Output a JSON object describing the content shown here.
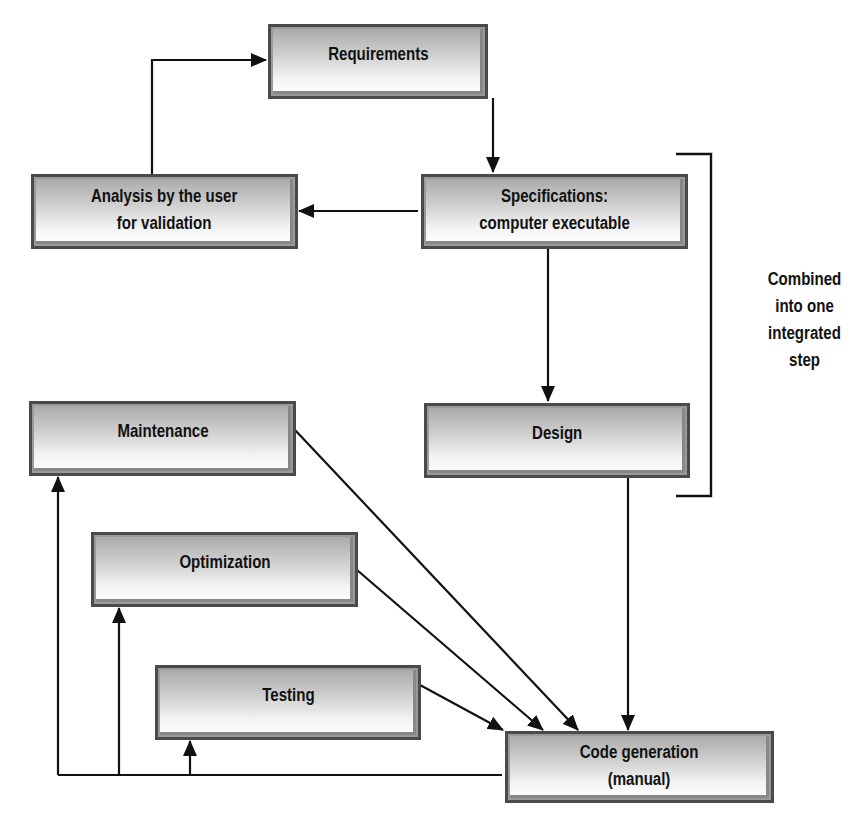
{
  "diagram": {
    "type": "flowchart",
    "nodes": {
      "requirements": {
        "label": "Requirements"
      },
      "analysis": {
        "label": "Analysis by the user\nfor validation"
      },
      "specifications": {
        "label": "Specifications:\ncomputer executable"
      },
      "maintenance": {
        "label": "Maintenance"
      },
      "design": {
        "label": "Design"
      },
      "optimization": {
        "label": "Optimization"
      },
      "testing": {
        "label": "Testing"
      },
      "code_generation": {
        "label": "Code generation\n(manual)"
      }
    },
    "bracket_note": {
      "label": "Combined\ninto one\nintegrated\nstep",
      "spans": [
        "specifications",
        "design"
      ]
    },
    "edges": [
      {
        "from": "analysis",
        "to": "requirements"
      },
      {
        "from": "requirements",
        "to": "specifications"
      },
      {
        "from": "specifications",
        "to": "analysis"
      },
      {
        "from": "specifications",
        "to": "design"
      },
      {
        "from": "design",
        "to": "code_generation"
      },
      {
        "from": "maintenance",
        "to": "code_generation"
      },
      {
        "from": "optimization",
        "to": "code_generation"
      },
      {
        "from": "testing",
        "to": "code_generation"
      },
      {
        "from": "code_generation",
        "to": "maintenance"
      },
      {
        "from": "code_generation",
        "to": "optimization"
      },
      {
        "from": "code_generation",
        "to": "testing"
      }
    ],
    "colors": {
      "line": "#111111",
      "box_border": "#4a4a4a",
      "box_gradient_top": "#a8a8a8",
      "box_gradient_bottom": "#ffffff"
    }
  }
}
